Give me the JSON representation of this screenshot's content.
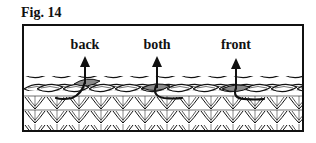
{
  "figure": {
    "title": "Fig. 14",
    "labels": [
      {
        "text": "back",
        "x": 61
      },
      {
        "text": "both",
        "x": 133
      },
      {
        "text": "front",
        "x": 213
      }
    ],
    "colors": {
      "line": "#111111",
      "highlight_loop": "#8a8a8a",
      "background": "#ffffff"
    }
  }
}
